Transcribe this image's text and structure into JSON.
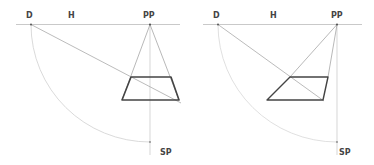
{
  "diagrams": [
    {
      "name": "perspective-square-centered",
      "labels": {
        "d": "D",
        "h": "H",
        "pp": "PP",
        "sp": "SP"
      },
      "horizon": {
        "x1": 16,
        "x2": 180,
        "y": 24.5
      },
      "points": {
        "D": [
          31,
          24.5
        ],
        "PP": [
          150,
          24.5
        ],
        "SP": [
          150,
          142
        ]
      },
      "shape": [
        [
          131,
          77
        ],
        [
          171,
          77
        ],
        [
          179,
          100
        ],
        [
          122,
          100
        ]
      ],
      "diagonal_end": [
        181,
        103
      ]
    },
    {
      "name": "perspective-square-offset",
      "labels": {
        "d": "D",
        "h": "H",
        "pp": "PP",
        "sp": "SP"
      },
      "horizon": {
        "x1": 203,
        "x2": 362,
        "y": 24.5
      },
      "points": {
        "D": [
          218,
          24.5
        ],
        "PP": [
          337,
          24.5
        ],
        "SP": [
          337,
          142
        ]
      },
      "shape": [
        [
          290,
          77
        ],
        [
          328,
          77
        ],
        [
          323,
          100
        ],
        [
          267,
          100
        ]
      ],
      "diagonal_end": [
        324,
        101
      ]
    }
  ],
  "colors": {
    "construction": "#bbbbbb",
    "arc": "#d0d0d0",
    "shape": "#444444",
    "label": "#444444"
  }
}
